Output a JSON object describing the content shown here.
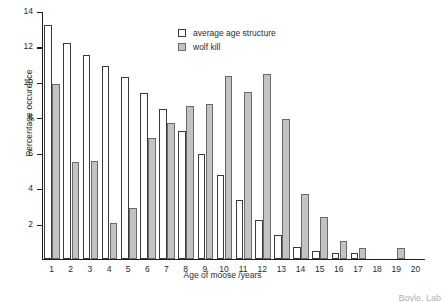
{
  "chart_data": {
    "type": "bar",
    "title": "",
    "xlabel": "Age of moose /years",
    "ylabel": "Percentage occurence",
    "categories": [
      "1",
      "2",
      "3",
      "4",
      "5",
      "6",
      "7",
      "8",
      "9",
      "10",
      "11",
      "12",
      "13",
      "14",
      "15",
      "16",
      "17",
      "18",
      "19",
      "20"
    ],
    "series": [
      {
        "name": "average age structure",
        "color": "#ffffff",
        "values": [
          13.2,
          12.2,
          11.5,
          10.9,
          10.3,
          9.4,
          8.45,
          7.25,
          5.95,
          4.75,
          3.35,
          2.2,
          1.35,
          0.7,
          0.45,
          0.35,
          0.35,
          0.0,
          0.0,
          0.0
        ]
      },
      {
        "name": "wolf kill",
        "color": "#c3c3c3",
        "values": [
          9.9,
          5.5,
          5.55,
          2.05,
          2.9,
          6.85,
          7.7,
          8.65,
          8.75,
          10.35,
          9.45,
          10.45,
          7.9,
          3.65,
          2.35,
          1.0,
          0.6,
          0.0,
          0.6,
          0.0
        ]
      }
    ],
    "ylim": [
      0,
      14
    ],
    "yticks": [
      2,
      4,
      6,
      8,
      10,
      12,
      14
    ],
    "xlim_categories": 20,
    "grid": false,
    "legend_position": "top-center"
  },
  "legend": {
    "items": [
      {
        "label": "average age structure"
      },
      {
        "label": "wolf kill"
      }
    ]
  },
  "caption_fragment": "Boyle, Lab"
}
